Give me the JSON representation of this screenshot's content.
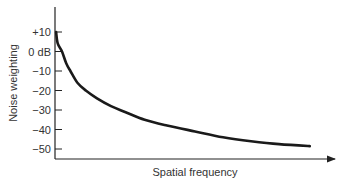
{
  "chart_data": {
    "type": "line",
    "title": "",
    "xlabel": "Spatial frequency",
    "ylabel": "Noise weighting",
    "ylim": [
      -55,
      20
    ],
    "xlim": [
      0,
      1
    ],
    "y_ticks": [
      {
        "value": 10,
        "label": "+10"
      },
      {
        "value": 0,
        "label": "0 dB"
      },
      {
        "value": -10,
        "label": "−10"
      },
      {
        "value": -20,
        "label": "−20"
      },
      {
        "value": -30,
        "label": "−30"
      },
      {
        "value": -40,
        "label": "−40"
      },
      {
        "value": -50,
        "label": "−50"
      }
    ],
    "x_ticks": [],
    "grid": false,
    "series": [
      {
        "name": "Noise weighting curve",
        "x": [
          0.004,
          0.01,
          0.025,
          0.04,
          0.055,
          0.08,
          0.11,
          0.15,
          0.2,
          0.25,
          0.32,
          0.4,
          0.5,
          0.6,
          0.7,
          0.8,
          0.91
        ],
        "y": [
          10,
          4,
          0,
          -6,
          -10,
          -16,
          -20,
          -24,
          -28,
          -31,
          -35,
          -38,
          -41,
          -44,
          -46,
          -47.5,
          -48.5
        ]
      }
    ]
  }
}
